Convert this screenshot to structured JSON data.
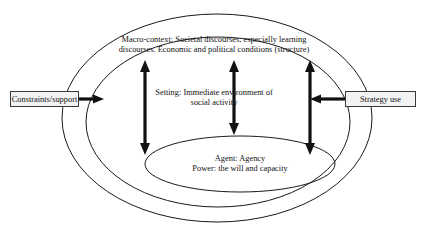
{
  "diagram": {
    "ellipses": [
      {
        "name": "macro-context",
        "label_line_1": "Macro-context: Societal discourses, especially learning",
        "label_line_2": "discourses. Economic and political conditions (structure)"
      },
      {
        "name": "setting",
        "label_line_1": "Setting: Immediate environment of",
        "label_line_2": "social activity"
      },
      {
        "name": "agent",
        "label_line_1": "Agent: Agency",
        "label_line_2": "Power: the will and capacity"
      }
    ],
    "external_boxes": [
      {
        "name": "constraints-support",
        "label": "Constraints/support"
      },
      {
        "name": "strategy-use",
        "label": "Strategy use"
      }
    ],
    "arrows": [
      {
        "name": "constraints-inward-arrow",
        "direction": "right",
        "heads": 1
      },
      {
        "name": "strategy-inward-arrow",
        "direction": "left",
        "heads": 1
      },
      {
        "name": "left-vertical-arrow",
        "direction": "vertical",
        "heads": 2
      },
      {
        "name": "center-vertical-arrow",
        "direction": "vertical",
        "heads": 2
      },
      {
        "name": "right-vertical-arrow",
        "direction": "vertical",
        "heads": 2
      }
    ],
    "colors": {
      "stroke": "#1a1a1a",
      "arrow": "#111111",
      "box_fill": "#f2f2f2",
      "box_border": "#3a3a3a",
      "background": "#ffffff"
    }
  }
}
